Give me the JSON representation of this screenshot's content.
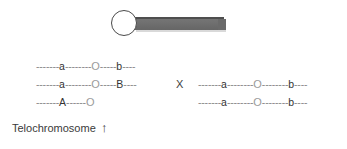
{
  "figure": {
    "title_label": "Telochromosome",
    "arrow_glyph": "↑",
    "cross_glyph": "X",
    "centromere_glyph": "O",
    "colors": {
      "background": "#ffffff",
      "arm_fill": "#6d6d6d",
      "arm_top_edge": "#4e4e4e",
      "circle_outline": "#4a4a4a",
      "dash_gray": "#8a8a8a",
      "text": "#3a3a3a"
    },
    "chromosome_glyph": {
      "centromere_shape": "open-circle",
      "arm_shape": "solid-bar"
    }
  },
  "genotypes": {
    "left": [
      {
        "id": "left-row-1",
        "segments": [
          {
            "type": "dashes",
            "text": "-------"
          },
          {
            "type": "allele",
            "text": "a"
          },
          {
            "type": "dashes",
            "text": "--------"
          },
          {
            "type": "centromere",
            "text": "O"
          },
          {
            "type": "dashes",
            "text": "-----"
          },
          {
            "type": "allele",
            "text": "b"
          },
          {
            "type": "dashes",
            "text": "----"
          }
        ]
      },
      {
        "id": "left-row-2",
        "segments": [
          {
            "type": "dashes",
            "text": "-------"
          },
          {
            "type": "allele",
            "text": "a"
          },
          {
            "type": "dashes",
            "text": "--------"
          },
          {
            "type": "centromere",
            "text": "O"
          },
          {
            "type": "dashes",
            "text": "-----"
          },
          {
            "type": "allele",
            "text": "B"
          },
          {
            "type": "dashes",
            "text": "----"
          }
        ]
      },
      {
        "id": "left-row-3",
        "segments": [
          {
            "type": "dashes",
            "text": "-------"
          },
          {
            "type": "allele",
            "text": "A"
          },
          {
            "type": "dashes",
            "text": "------"
          },
          {
            "type": "centromere",
            "text": "O"
          }
        ]
      }
    ],
    "right": [
      {
        "id": "right-row-1",
        "segments": [
          {
            "type": "dashes",
            "text": "-------"
          },
          {
            "type": "allele",
            "text": "a"
          },
          {
            "type": "dashes",
            "text": "--------"
          },
          {
            "type": "centromere",
            "text": "O"
          },
          {
            "type": "dashes",
            "text": "--------"
          },
          {
            "type": "allele",
            "text": "b"
          },
          {
            "type": "dashes",
            "text": "----"
          }
        ]
      },
      {
        "id": "right-row-2",
        "segments": [
          {
            "type": "dashes",
            "text": "-------"
          },
          {
            "type": "allele",
            "text": "a"
          },
          {
            "type": "dashes",
            "text": "--------"
          },
          {
            "type": "centromere",
            "text": "O"
          },
          {
            "type": "dashes",
            "text": "--------"
          },
          {
            "type": "allele",
            "text": "b"
          },
          {
            "type": "dashes",
            "text": "----"
          }
        ]
      }
    ]
  }
}
